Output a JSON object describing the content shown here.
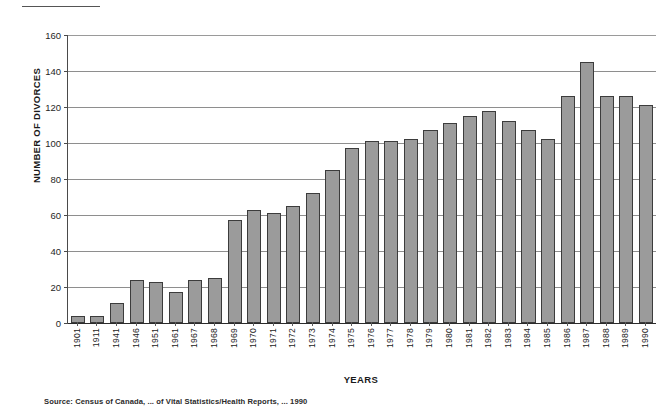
{
  "chart_data": {
    "type": "bar",
    "title": "",
    "xlabel": "YEARS",
    "ylabel": "NUMBER OF DIVORCES",
    "ylim": [
      0,
      160
    ],
    "ytick_step": 20,
    "yticks": [
      160,
      140,
      120,
      100,
      80,
      60,
      40,
      20,
      0
    ],
    "grid": true,
    "legend": "none",
    "bar_color": "#9b9b9b",
    "bar_edge_color": "#3c3c3c",
    "categories": [
      "1901",
      "1911",
      "1941",
      "1946",
      "1951",
      "1961",
      "1967",
      "1968",
      "1969",
      "1970",
      "1971",
      "1972",
      "1973",
      "1974",
      "1975",
      "1976",
      "1977",
      "1978",
      "1979",
      "1980",
      "1981",
      "1982",
      "1983",
      "1984",
      "1985",
      "1986",
      "1987",
      "1988",
      "1989",
      "1990"
    ],
    "values": [
      4,
      4,
      11,
      24,
      23,
      17,
      24,
      25,
      57,
      63,
      61,
      65,
      72,
      85,
      97,
      101,
      101,
      102,
      107,
      111,
      118,
      112,
      107,
      102,
      126,
      145,
      126,
      126,
      121,
      0
    ],
    "series": [
      {
        "name": "Number of divorces",
        "points": [
          {
            "year": "1901",
            "value": 4
          },
          {
            "year": "1911",
            "value": 4
          },
          {
            "year": "1941",
            "value": 11
          },
          {
            "year": "1946",
            "value": 24
          },
          {
            "year": "1951",
            "value": 23
          },
          {
            "year": "1961",
            "value": 17
          },
          {
            "year": "1967",
            "value": 24
          },
          {
            "year": "1968",
            "value": 25
          },
          {
            "year": "1969",
            "value": 57
          },
          {
            "year": "1970",
            "value": 63
          },
          {
            "year": "1971",
            "value": 61
          },
          {
            "year": "1972",
            "value": 65
          },
          {
            "year": "1973",
            "value": 72
          },
          {
            "year": "1974",
            "value": 85
          },
          {
            "year": "1975",
            "value": 97
          },
          {
            "year": "1976",
            "value": 101
          },
          {
            "year": "1977",
            "value": 101
          },
          {
            "year": "1978",
            "value": 102
          },
          {
            "year": "1979",
            "value": 107
          },
          {
            "year": "1980",
            "value": 111
          },
          {
            "year": "1981",
            "value": 115
          },
          {
            "year": "1982",
            "value": 118
          },
          {
            "year": "1983",
            "value": 112
          },
          {
            "year": "1984",
            "value": 107
          },
          {
            "year": "1985",
            "value": 102
          },
          {
            "year": "1986",
            "value": 126
          },
          {
            "year": "1987",
            "value": 145
          },
          {
            "year": "1988",
            "value": 126
          },
          {
            "year": "1989",
            "value": 126
          },
          {
            "year": "1990",
            "value": 121
          }
        ]
      }
    ]
  },
  "source_note": "Source: Census of Canada, ... of Vital Statistics/Health Reports, ... 1990"
}
